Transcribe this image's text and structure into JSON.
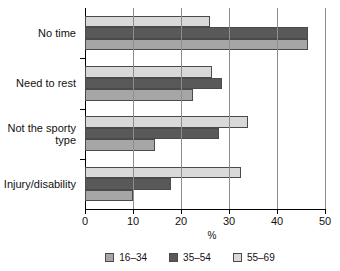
{
  "chart_data": {
    "type": "bar",
    "orientation": "horizontal",
    "title": "",
    "xlabel": "%",
    "ylabel": "",
    "xlim": [
      0,
      50
    ],
    "xticks": [
      0,
      10,
      20,
      30,
      40,
      50
    ],
    "xtick_labels": [
      "0",
      "10",
      "20",
      "30",
      "40",
      "50"
    ],
    "grid": "vertical",
    "legend_position": "bottom",
    "categories": [
      "No time",
      "Need to rest",
      "Not the sporty\ntype",
      "Injury/disability"
    ],
    "series": [
      {
        "name": "16–34",
        "color": "#a6a6a6",
        "values": [
          46.5,
          22.5,
          14.5,
          10.0
        ]
      },
      {
        "name": "35–54",
        "color": "#595959",
        "values": [
          46.5,
          28.5,
          28.0,
          18.0
        ]
      },
      {
        "name": "55–69",
        "color": "#d9d9d9",
        "values": [
          26.0,
          26.5,
          34.0,
          32.5
        ]
      }
    ]
  },
  "legend": {
    "items": [
      {
        "label": "16–34"
      },
      {
        "label": "35–54"
      },
      {
        "label": "55–69"
      }
    ]
  },
  "colors": {
    "series_16_34": "#a6a6a6",
    "series_35_54": "#595959",
    "series_55_69": "#d9d9d9",
    "axis": "#000000",
    "gridline": "#8d8d8d",
    "background": "#ffffff"
  }
}
